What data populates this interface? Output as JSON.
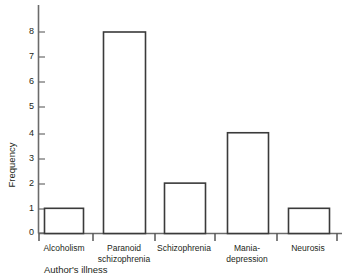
{
  "chart_data": {
    "type": "bar",
    "title": "",
    "xlabel": "Author's illness",
    "ylabel": "Frequency",
    "categories": [
      "Alcoholism",
      "Paranoid\nschizophrenia",
      "Schizophrenia",
      "Mania-\ndepression",
      "Neurosis"
    ],
    "values": [
      1,
      8,
      2,
      4,
      1
    ],
    "ylim": [
      0,
      8
    ],
    "yticks": [
      0,
      1,
      2,
      3,
      4,
      5,
      6,
      7,
      8
    ],
    "ytick_labels": [
      "0",
      "1",
      "2",
      "3",
      "4",
      "5",
      "6",
      "7",
      "8"
    ],
    "grid": false,
    "legend": false,
    "bar_fill": "#ffffff",
    "bar_edge": "#3a3a3a",
    "axis_color": "#6b6b6b",
    "text_color": "#231f20",
    "background": "#ffffff"
  },
  "axis": {
    "y_label": "Frequency",
    "x_label": "Author's illness",
    "ticks": [
      {
        "value": "8",
        "y": 32
      },
      {
        "value": "7",
        "y": 57
      },
      {
        "value": "6",
        "y": 82
      },
      {
        "value": "5",
        "y": 107
      },
      {
        "value": "4",
        "y": 134
      },
      {
        "value": "3",
        "y": 159
      },
      {
        "value": "2",
        "y": 184
      },
      {
        "value": "1",
        "y": 209
      },
      {
        "value": "0",
        "y": 233
      }
    ]
  },
  "bars": [
    {
      "label": "Alcoholism",
      "value": 1,
      "x": 44,
      "width": 39,
      "label_x": 40,
      "label_w": 48,
      "label_y": 240
    },
    {
      "label": "Paranoid\nschizophrenia",
      "value": 8,
      "x": 103,
      "width": 42,
      "label_x": 92,
      "label_w": 64,
      "label_y": 240
    },
    {
      "label": "Schizophrenia",
      "value": 2,
      "x": 164,
      "width": 41,
      "label_x": 152,
      "label_w": 64,
      "label_y": 240
    },
    {
      "label": "Mania-\ndepression",
      "value": 4,
      "x": 227,
      "width": 41,
      "label_x": 216,
      "label_w": 62,
      "label_y": 240
    },
    {
      "label": "Neurosis",
      "value": 1,
      "x": 288,
      "width": 41,
      "label_x": 282,
      "label_w": 52,
      "label_y": 240
    }
  ]
}
